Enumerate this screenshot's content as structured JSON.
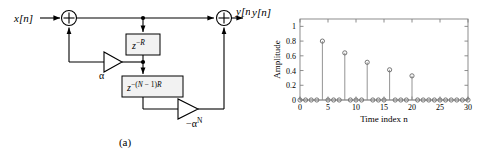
{
  "figure": {
    "panels": [
      {
        "id": "a",
        "caption": "(a)",
        "type": "block-diagram",
        "title": "Comb filter structure block diagram",
        "input_label": "x[n]",
        "output_label": "y[n]",
        "adders": [
          {
            "name": "input-adder",
            "sign": "+"
          },
          {
            "name": "output-adder",
            "sign": "+"
          }
        ],
        "delay_blocks": [
          {
            "name": "delay-block-r",
            "base": "z",
            "exponent": "−R",
            "label": "z^-R"
          },
          {
            "name": "delay-block-n1r",
            "base": "z",
            "exponent": "−(N − 1)R",
            "label": "z^-(N-1)R"
          }
        ],
        "gains": [
          {
            "name": "gain-alpha",
            "label": "α"
          },
          {
            "name": "gain-neg-alpha-n",
            "label": "−α",
            "exponent": "N"
          }
        ]
      },
      {
        "id": "b",
        "caption": "(b)",
        "type": "stem-plot",
        "output_label": "y[n]"
      }
    ]
  },
  "chart_data": {
    "type": "scatter",
    "plot_style": "stem",
    "title": "",
    "xlabel": "Time index n",
    "ylabel": "Amplitude",
    "xlim": [
      0,
      30
    ],
    "ylim": [
      0,
      1.1
    ],
    "xticks": [
      0,
      5,
      10,
      15,
      20,
      25,
      30
    ],
    "xticklabels": [
      "0",
      "5",
      "10",
      "15",
      "20",
      "25",
      "30"
    ],
    "yticks": [
      0,
      0.2,
      0.4,
      0.6,
      0.8,
      1
    ],
    "yticklabels": [
      "0",
      "0.2",
      "0.4",
      "0.6",
      "0.8",
      "1"
    ],
    "grid": false,
    "legend": null,
    "marker": "circle-open",
    "x": [
      0,
      1,
      2,
      3,
      4,
      5,
      6,
      7,
      8,
      9,
      10,
      11,
      12,
      13,
      14,
      15,
      16,
      17,
      18,
      19,
      20,
      21,
      22,
      23,
      24,
      25,
      26,
      27,
      28,
      29,
      30
    ],
    "values": [
      0,
      0,
      0,
      0,
      0.8,
      0,
      0,
      0,
      0.64,
      0,
      0,
      0,
      0.512,
      0,
      0,
      0,
      0.41,
      0,
      0,
      0,
      0.328,
      0,
      0,
      0,
      0,
      0,
      0,
      0,
      0,
      0,
      0
    ],
    "nonzero_points": [
      {
        "n": 4,
        "amplitude": 0.8
      },
      {
        "n": 8,
        "amplitude": 0.64
      },
      {
        "n": 12,
        "amplitude": 0.512
      },
      {
        "n": 16,
        "amplitude": 0.41
      },
      {
        "n": 20,
        "amplitude": 0.328
      }
    ]
  },
  "colors": {
    "line": "#000000",
    "axis": "#808080",
    "marker": "#666666",
    "stem": "#888888",
    "block_fill": "#f2f2f2",
    "background": "#ffffff"
  }
}
